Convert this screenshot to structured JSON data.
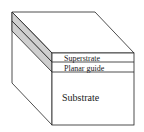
{
  "diagram": {
    "layers": [
      {
        "name": "superstrate",
        "label": "Superstrate"
      },
      {
        "name": "planar-guide",
        "label": "Planar guide"
      },
      {
        "name": "substrate",
        "label": "Substrate"
      }
    ],
    "colors": {
      "stroke": "#222222",
      "face": "#ffffff",
      "side_layer": "#cfcfcf"
    }
  }
}
